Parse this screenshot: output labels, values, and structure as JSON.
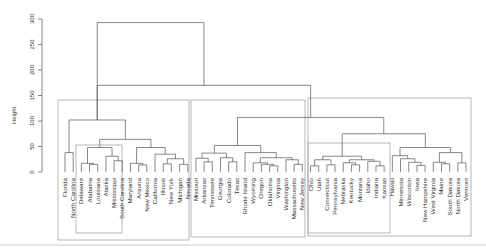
{
  "chart_data": {
    "type": "dendrogram",
    "title": "",
    "xlabel": "",
    "ylabel": "Height",
    "ylim": [
      0,
      300
    ],
    "yticks": [
      0,
      50,
      100,
      150,
      200,
      250,
      300
    ],
    "leaves": [
      "Florida",
      "North Carolina",
      "Delaware",
      "Alabama",
      "Louisiana",
      "Alaska",
      "Mississippi",
      "South Carolina",
      "Maryland",
      "Arizona",
      "New Mexico",
      "California",
      "Illinois",
      "New York",
      "Michigan",
      "Nevada",
      "Missouri",
      "Arkansas",
      "Tennessee",
      "Georgia",
      "Colorado",
      "Texas",
      "Rhode Island",
      "Wyoming",
      "Oregon",
      "Oklahoma",
      "Virginia",
      "Washington",
      "Massachusetts",
      "New Jersey",
      "Ohio",
      "Utah",
      "Connecticut",
      "Pennsylvania",
      "Nebraska",
      "Kentucky",
      "Montana",
      "Idaho",
      "Indiana",
      "Kansas",
      "Hawaii",
      "Minnesota",
      "Wisconsin",
      "Iowa",
      "New Hampshire",
      "West Virginia",
      "Maine",
      "South Dakota",
      "North Dakota",
      "Vermont"
    ],
    "merges": [
      {
        "id": "m1",
        "a": "Florida",
        "b": "North Carolina",
        "h": 38
      },
      {
        "id": "m2",
        "a": "Alabama",
        "b": "Louisiana",
        "h": 15
      },
      {
        "id": "m3",
        "a": "Delaware",
        "b": "m2",
        "h": 17
      },
      {
        "id": "m4",
        "a": "Mississippi",
        "b": "South Carolina",
        "h": 22
      },
      {
        "id": "m5",
        "a": "Alaska",
        "b": "m4",
        "h": 31
      },
      {
        "id": "m6",
        "a": "m3",
        "b": "m5",
        "h": 48
      },
      {
        "id": "m7",
        "a": "Arizona",
        "b": "New Mexico",
        "h": 14
      },
      {
        "id": "m8",
        "a": "Maryland",
        "b": "m7",
        "h": 17
      },
      {
        "id": "m9",
        "a": "Illinois",
        "b": "New York",
        "h": 16
      },
      {
        "id": "m10",
        "a": "Michigan",
        "b": "Nevada",
        "h": 15
      },
      {
        "id": "m11",
        "a": "m9",
        "b": "m10",
        "h": 26
      },
      {
        "id": "m12",
        "a": "California",
        "b": "m11",
        "h": 35
      },
      {
        "id": "m13",
        "a": "m8",
        "b": "m12",
        "h": 48
      },
      {
        "id": "m14",
        "a": "m6",
        "b": "m13",
        "h": 64
      },
      {
        "id": "m15",
        "a": "m1",
        "b": "m14",
        "h": 102
      },
      {
        "id": "m16",
        "a": "Arkansas",
        "b": "Tennessee",
        "h": 20
      },
      {
        "id": "m17",
        "a": "Missouri",
        "b": "m16",
        "h": 27
      },
      {
        "id": "m18",
        "a": "Colorado",
        "b": "Texas",
        "h": 20
      },
      {
        "id": "m19",
        "a": "Georgia",
        "b": "m18",
        "h": 28
      },
      {
        "id": "m20",
        "a": "m17",
        "b": "m19",
        "h": 37
      },
      {
        "id": "m21",
        "a": "Oklahoma",
        "b": "Virginia",
        "h": 12
      },
      {
        "id": "m22",
        "a": "Oregon",
        "b": "m21",
        "h": 15
      },
      {
        "id": "m23",
        "a": "Wyoming",
        "b": "m22",
        "h": 18
      },
      {
        "id": "m24",
        "a": "Massachusetts",
        "b": "New Jersey",
        "h": 15
      },
      {
        "id": "m25",
        "a": "Washington",
        "b": "m24",
        "h": 24
      },
      {
        "id": "m26",
        "a": "m23",
        "b": "m25",
        "h": 28
      },
      {
        "id": "m27",
        "a": "Rhode Island",
        "b": "m26",
        "h": 38
      },
      {
        "id": "m28",
        "a": "m20",
        "b": "m27",
        "h": 52
      },
      {
        "id": "m29",
        "a": "Ohio",
        "b": "Utah",
        "h": 12
      },
      {
        "id": "m30",
        "a": "Connecticut",
        "b": "Pennsylvania",
        "h": 14
      },
      {
        "id": "m31",
        "a": "m29",
        "b": "m30",
        "h": 24
      },
      {
        "id": "m32",
        "a": "Kentucky",
        "b": "Montana",
        "h": 14
      },
      {
        "id": "m33",
        "a": "Nebraska",
        "b": "m32",
        "h": 18
      },
      {
        "id": "m34",
        "a": "Indiana",
        "b": "Kansas",
        "h": 12
      },
      {
        "id": "m35",
        "a": "Idaho",
        "b": "m34",
        "h": 21
      },
      {
        "id": "m36",
        "a": "m33",
        "b": "m35",
        "h": 24
      },
      {
        "id": "m37",
        "a": "m31",
        "b": "m36",
        "h": 31
      },
      {
        "id": "m38",
        "a": "Iowa",
        "b": "New Hampshire",
        "h": 13
      },
      {
        "id": "m39",
        "a": "Wisconsin",
        "b": "m38",
        "h": 19
      },
      {
        "id": "m40",
        "a": "Minnesota",
        "b": "m39",
        "h": 26
      },
      {
        "id": "m41",
        "a": "Hawaii",
        "b": "m40",
        "h": 32
      },
      {
        "id": "m42",
        "a": "Maine",
        "b": "South Dakota",
        "h": 16
      },
      {
        "id": "m43",
        "a": "West Virginia",
        "b": "m42",
        "h": 19
      },
      {
        "id": "m44",
        "a": "North Dakota",
        "b": "Vermont",
        "h": 18
      },
      {
        "id": "m45",
        "a": "m43",
        "b": "m44",
        "h": 38
      },
      {
        "id": "m46",
        "a": "m41",
        "b": "m45",
        "h": 48
      },
      {
        "id": "m47",
        "a": "m37",
        "b": "m46",
        "h": 75
      },
      {
        "id": "m48",
        "a": "m28",
        "b": "m47",
        "h": 107
      },
      {
        "id": "m49",
        "a": "m15",
        "b": "m48",
        "h": 170
      },
      {
        "id": "m50",
        "a": "m15",
        "b": "m49",
        "h": 293
      }
    ],
    "root": "m50",
    "cluster_boxes": [
      {
        "name": "cluster-1",
        "x0": 58,
        "x1": 189,
        "y0": 100,
        "y1": 240
      },
      {
        "name": "cluster-1a",
        "x0": 76,
        "x1": 122,
        "y0": 145,
        "y1": 233
      },
      {
        "name": "cluster-2",
        "x0": 191,
        "x1": 305,
        "y0": 100,
        "y1": 237
      },
      {
        "name": "cluster-3",
        "x0": 308,
        "x1": 471,
        "y0": 98,
        "y1": 236
      },
      {
        "name": "cluster-3a",
        "x0": 308,
        "x1": 390,
        "y0": 143,
        "y1": 233
      }
    ],
    "colors": {
      "lines": "#555555",
      "boxes": "#999999",
      "text": "#333333",
      "separator": "#cccccc"
    }
  }
}
